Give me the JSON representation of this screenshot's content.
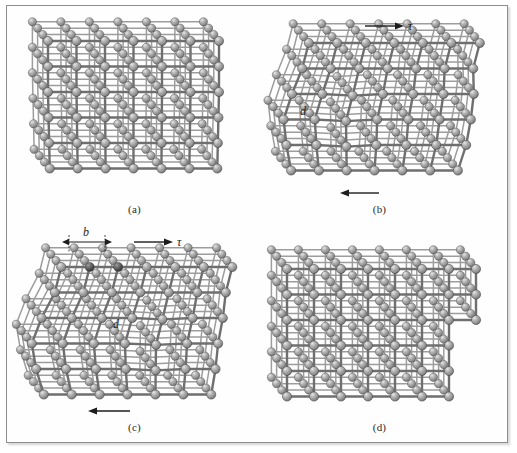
{
  "figure": {
    "title_visible": false,
    "background_color": "#ffffff",
    "frame_color": "#8d8d8d",
    "atom_color": "#9a9a9a",
    "atom_highlight_color": "#d8d8d8",
    "atom_shadow_color": "#5a5a5a",
    "bond_color": "#6f6f6f",
    "annotation_color": "#1d1d1d"
  },
  "panels": [
    {
      "id": "panel-a",
      "caption": "(a)",
      "description": "perfect-region lattice before slip, edge dislocation at center",
      "annotations": []
    },
    {
      "id": "panel-b",
      "caption": "(b)",
      "description": "lattice sheared, dislocation half-plane labeled d",
      "annotations": [
        {
          "name": "shear-stress-top",
          "label": "τ",
          "direction": "right"
        },
        {
          "name": "dislocation-label",
          "label": "d"
        },
        {
          "name": "shear-stress-bottom",
          "label": "",
          "direction": "left"
        }
      ]
    },
    {
      "id": "panel-c",
      "caption": "(c)",
      "description": "dislocation advanced one Burgers vector, spacing b marked on top row",
      "annotations": [
        {
          "name": "burgers-vector-label",
          "label": "b"
        },
        {
          "name": "shear-stress-top",
          "label": "τ",
          "direction": "right"
        },
        {
          "name": "dislocation-label",
          "label": "d"
        },
        {
          "name": "shear-stress-bottom",
          "label": "",
          "direction": "left"
        }
      ]
    },
    {
      "id": "panel-d",
      "caption": "(d)",
      "description": "dislocation exits crystal leaving a unit step on the right surface",
      "annotations": []
    }
  ],
  "symbols": {
    "tau": "τ",
    "d": "d",
    "b": "b"
  },
  "captions": {
    "a": "(a)",
    "b": "(b)",
    "c": "(c)",
    "d": "(d)"
  }
}
